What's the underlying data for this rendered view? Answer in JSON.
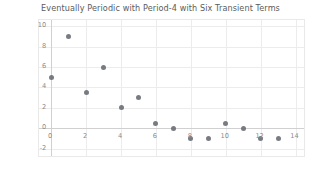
{
  "chart_data": {
    "type": "scatter",
    "title": "Eventually Periodic with Period-4 with Six Transient Terms",
    "xlabel": "",
    "ylabel": "",
    "x": [
      0,
      1,
      2,
      3,
      4,
      5,
      6,
      7,
      8,
      9,
      10,
      11,
      12,
      13
    ],
    "values": [
      5,
      9,
      3.5,
      6,
      2,
      3,
      0.5,
      0,
      -1,
      -1,
      0.5,
      0,
      -1,
      -1
    ],
    "series": [
      {
        "name": "sequence",
        "x": [
          0,
          1,
          2,
          3,
          4,
          5,
          6,
          7,
          8,
          9,
          10,
          11,
          12,
          13
        ],
        "values": [
          5,
          9,
          3.5,
          6,
          2,
          3,
          0.5,
          0,
          -1,
          -1,
          0.5,
          0,
          -1,
          -1
        ]
      }
    ],
    "xlim": [
      -0.7,
      14.6
    ],
    "ylim": [
      -2.9,
      10.6
    ],
    "xticks": [
      0,
      2,
      4,
      6,
      8,
      10,
      12,
      14
    ],
    "xtick_labels": [
      "0",
      "2",
      "4",
      "6",
      "8",
      "10",
      "12",
      "14"
    ],
    "yticks": [
      -2,
      0,
      2,
      4,
      6,
      8,
      10
    ],
    "ytick_labels": [
      "-2",
      "0",
      "2",
      "4",
      "6",
      "8",
      "10"
    ],
    "grid": true,
    "legend": null,
    "marker_color": "#6e7077",
    "grid_color": "#ececec",
    "axis_color": "#d0d0d0",
    "background_color": "#ffffff",
    "title_color": "#5b5b5b",
    "tick_label_color": "#8a8a8a"
  }
}
